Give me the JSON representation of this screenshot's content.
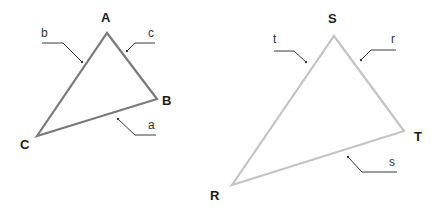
{
  "colors": {
    "triangle_left_stroke": "#7a7a7a",
    "triangle_right_stroke": "#c4c4c4",
    "label_color": "#1a1a1a",
    "leader_color": "#3a3a3a"
  },
  "triangles": [
    {
      "name": "ABC",
      "vertices": [
        {
          "label": "A",
          "x": 107,
          "y": 33
        },
        {
          "label": "B",
          "x": 157,
          "y": 99
        },
        {
          "label": "C",
          "x": 37,
          "y": 136
        }
      ],
      "sides": [
        {
          "label": "b",
          "between": "A-C"
        },
        {
          "label": "c",
          "between": "A-B"
        },
        {
          "label": "a",
          "between": "B-C"
        }
      ]
    },
    {
      "name": "RST",
      "vertices": [
        {
          "label": "S",
          "x": 334,
          "y": 36
        },
        {
          "label": "T",
          "x": 404,
          "y": 131
        },
        {
          "label": "R",
          "x": 232,
          "y": 185
        }
      ],
      "sides": [
        {
          "label": "t",
          "between": "S-R"
        },
        {
          "label": "r",
          "between": "S-T"
        },
        {
          "label": "s",
          "between": "R-T"
        }
      ]
    }
  ]
}
